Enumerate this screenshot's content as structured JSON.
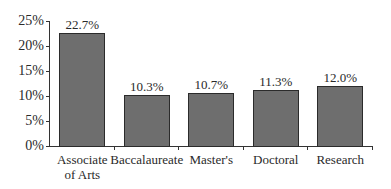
{
  "chart_data": {
    "type": "bar",
    "title": "",
    "xlabel": "",
    "ylabel": "",
    "categories": [
      "Associate of Arts",
      "Baccalaureate",
      "Master's",
      "Doctoral",
      "Research"
    ],
    "category_lines": [
      [
        "Associate",
        "of Arts"
      ],
      [
        "Baccalaureate"
      ],
      [
        "Master's"
      ],
      [
        "Doctoral"
      ],
      [
        "Research"
      ]
    ],
    "values": [
      22.7,
      10.3,
      10.7,
      11.3,
      12.0
    ],
    "value_labels": [
      "22.7%",
      "10.3%",
      "10.7%",
      "11.3%",
      "12.0%"
    ],
    "ylim": [
      0,
      25
    ],
    "yticks": [
      0,
      5,
      10,
      15,
      20,
      25
    ],
    "ytick_labels": [
      "0%",
      "5%",
      "10%",
      "15%",
      "20%",
      "25%"
    ],
    "grid": false,
    "legend": null,
    "bar_color": "#6e6e6e",
    "bar_edge_color": "#2b2b2b"
  }
}
